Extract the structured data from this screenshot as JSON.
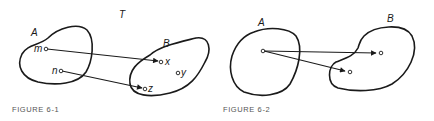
{
  "figures": [
    {
      "caption": "FIGURE 6-1",
      "mapping_label": "T",
      "sets": [
        {
          "name": "A",
          "elements": [
            "m",
            "n"
          ]
        },
        {
          "name": "B",
          "elements": [
            "x",
            "y",
            "z"
          ]
        }
      ],
      "arrows": [
        {
          "from": "m",
          "to": "x"
        },
        {
          "from": "n",
          "to": "z"
        }
      ]
    },
    {
      "caption": "FIGURE 6-2",
      "sets": [
        {
          "name": "A",
          "elements": [
            ""
          ]
        },
        {
          "name": "B",
          "elements": [
            "",
            ""
          ]
        }
      ],
      "arrows": [
        {
          "from": "A point",
          "to": "B upper point"
        },
        {
          "from": "A point",
          "to": "B lower point"
        }
      ]
    }
  ],
  "labels": {
    "fig1": {
      "T": "T",
      "A": "A",
      "B": "B",
      "m": "m",
      "n": "n",
      "x": "x",
      "y": "y",
      "z": "z"
    },
    "fig2": {
      "A": "A",
      "B": "B"
    }
  },
  "colors": {
    "stroke": "#1a1a1a",
    "caption": "#555555",
    "background": "#ffffff"
  }
}
